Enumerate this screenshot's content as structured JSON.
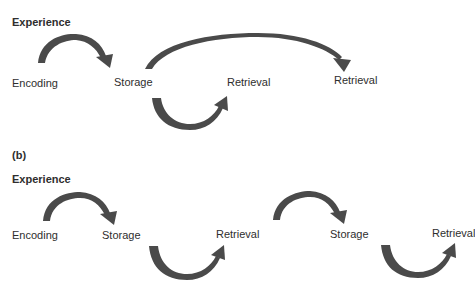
{
  "colors": {
    "arrow": "#4a4a4a",
    "text": "#2e2e2e",
    "background": "#ffffff"
  },
  "panel_a": {
    "heading": "Experience",
    "nodes": [
      {
        "label": "Encoding"
      },
      {
        "label": "Storage"
      },
      {
        "label": "Retrieval"
      },
      {
        "label": "Retrieval"
      }
    ],
    "arrows": [
      {
        "from": "Encoding",
        "to": "Storage",
        "direction": "over"
      },
      {
        "from": "Storage",
        "to": "Retrieval",
        "direction": "under"
      },
      {
        "from": "Storage",
        "to": "Retrieval (far)",
        "direction": "over"
      }
    ]
  },
  "panel_b": {
    "panel_label": "(b)",
    "heading": "Experience",
    "nodes": [
      {
        "label": "Encoding"
      },
      {
        "label": "Storage"
      },
      {
        "label": "Retrieval"
      },
      {
        "label": "Storage"
      },
      {
        "label": "Retrieval"
      }
    ],
    "arrows": [
      {
        "from": "Encoding",
        "to": "Storage",
        "direction": "over"
      },
      {
        "from": "Storage",
        "to": "Retrieval",
        "direction": "under"
      },
      {
        "from": "Retrieval",
        "to": "Storage",
        "direction": "over"
      },
      {
        "from": "Storage",
        "to": "Retrieval",
        "direction": "under"
      }
    ]
  }
}
